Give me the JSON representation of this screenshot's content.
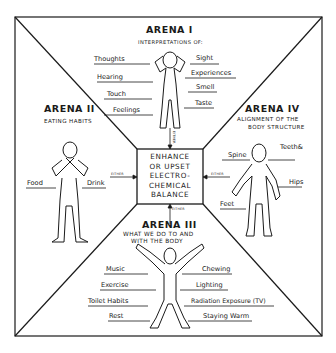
{
  "arenas": {
    "arena1": {
      "title": "ARENA I",
      "subtitle": "INTERPRETATIONS OF:",
      "left_labels": [
        "Thoughts",
        "Hearing",
        "Touch",
        "Feelings"
      ],
      "right_labels": [
        "Sight",
        "Experiences",
        "Smell",
        "Taste"
      ]
    },
    "arena2": {
      "title": "ARENA II",
      "subtitle": "EATING HABITS",
      "left_labels": [
        "Food"
      ],
      "right_labels": [
        "Drink"
      ]
    },
    "arena3": {
      "title": "ARENA III",
      "subtitle_line1": "WHAT WE DO TO AND",
      "subtitle_line2": "WITH THE BODY",
      "left_labels": [
        "Music",
        "Exercise",
        "Toilet Habits",
        "Rest"
      ],
      "right_labels": [
        "Chewing",
        "Lighting",
        "Radiation Exposure (TV)",
        "Staying Warm"
      ]
    },
    "arena4": {
      "title": "ARENA IV",
      "subtitle_line1": "ALIGNMENT OF THE",
      "subtitle_line2": "BODY STRUCTURE",
      "labels": {
        "spine": "Spine",
        "teeth_line1": "Teeth&",
        "teeth_line2": "Bite",
        "hips": "Hips",
        "feet": "Feet"
      }
    }
  },
  "center": {
    "line1": "ENHANCE",
    "line2": "OR UPSET",
    "line3": "ELECTRO-",
    "line4": "CHEMICAL",
    "line5": "BALANCE"
  },
  "connectors": {
    "top": "EITHER",
    "left": "EITHER",
    "right": "EITHER",
    "bottom": "EITHER"
  },
  "colors": {
    "ink": "#1a1a1a",
    "paper": "#ffffff"
  }
}
